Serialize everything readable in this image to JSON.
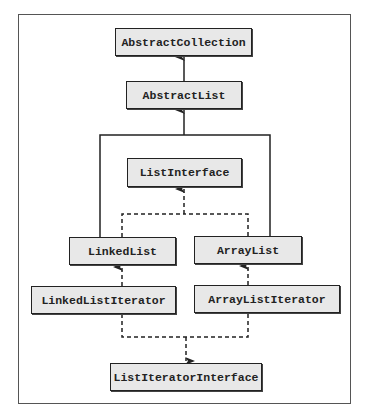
{
  "diagram": {
    "type": "class-hierarchy",
    "nodes": {
      "abstract_collection": "AbstractCollection",
      "abstract_list": "AbstractList",
      "list_interface": "ListInterface",
      "linked_list": "LinkedList",
      "array_list": "ArrayList",
      "linked_list_iterator": "LinkedListIterator",
      "array_list_iterator": "ArrayListIterator",
      "list_iterator_interface": "ListIteratorInterface"
    },
    "edges": [
      {
        "from": "AbstractList",
        "to": "AbstractCollection",
        "style": "solid",
        "meaning": "extends"
      },
      {
        "from": "LinkedList",
        "to": "AbstractList",
        "style": "solid",
        "meaning": "extends"
      },
      {
        "from": "ArrayList",
        "to": "AbstractList",
        "style": "solid",
        "meaning": "extends"
      },
      {
        "from": "LinkedList",
        "to": "ListInterface",
        "style": "dashed",
        "meaning": "implements"
      },
      {
        "from": "ArrayList",
        "to": "ListInterface",
        "style": "dashed",
        "meaning": "implements"
      },
      {
        "from": "LinkedListIterator",
        "to": "LinkedList",
        "style": "dashed"
      },
      {
        "from": "ArrayListIterator",
        "to": "ArrayList",
        "style": "dashed"
      },
      {
        "from": "LinkedListIterator",
        "to": "ListIteratorInterface",
        "style": "dashed",
        "meaning": "implements"
      },
      {
        "from": "ArrayListIterator",
        "to": "ListIteratorInterface",
        "style": "dashed",
        "meaning": "implements"
      }
    ],
    "colors": {
      "box_fill": "#e8e8e8",
      "box_border": "#222222",
      "line": "#222222",
      "frame": "#555555"
    }
  }
}
